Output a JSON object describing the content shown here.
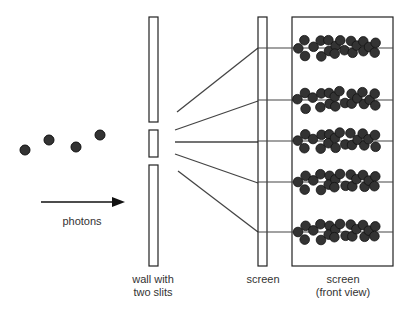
{
  "labels": {
    "photons": "photons",
    "wall_line1": "wall with",
    "wall_line2": "two slits",
    "screen": "screen",
    "front_line1": "screen",
    "front_line2": "(front view)"
  },
  "colors": {
    "stroke": "#222222",
    "ray": "#444444",
    "dot_fill": "#333333",
    "dot_stroke": "#111111",
    "background": "#ffffff"
  },
  "photons": [
    {
      "x": 25,
      "y": 150
    },
    {
      "x": 49,
      "y": 140
    },
    {
      "x": 76,
      "y": 147
    },
    {
      "x": 100,
      "y": 135
    }
  ],
  "arrow": {
    "x1": 41,
    "y1": 202,
    "x2": 125,
    "y2": 202
  },
  "wall": {
    "x": 149,
    "width": 9,
    "segments": [
      {
        "y": 17,
        "height": 105
      },
      {
        "y": 130,
        "height": 27
      },
      {
        "y": 165,
        "height": 101
      }
    ]
  },
  "screen": {
    "x": 258,
    "y": 17,
    "width": 9,
    "height": 249
  },
  "front_view": {
    "x": 292,
    "y": 17,
    "width": 101,
    "height": 249
  },
  "rays": [
    {
      "x1": 177,
      "y1": 112,
      "x2": 258,
      "y2": 48
    },
    {
      "x1": 175,
      "y1": 130,
      "x2": 258,
      "y2": 101
    },
    {
      "x1": 175,
      "y1": 142,
      "x2": 258,
      "y2": 142
    },
    {
      "x1": 175,
      "y1": 154,
      "x2": 258,
      "y2": 183
    },
    {
      "x1": 178,
      "y1": 171,
      "x2": 258,
      "y2": 232
    }
  ],
  "bands_y": [
    48,
    100,
    141,
    182,
    232
  ]
}
